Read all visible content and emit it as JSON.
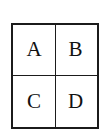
{
  "figure": {
    "kind": "2x2-grid-diagram",
    "background_color": "#ffffff",
    "line_color": "#1b1b1b",
    "text_color": "#111111",
    "rows": 2,
    "columns": 2,
    "cells": [
      {
        "id": "a",
        "label": "A",
        "row": 1,
        "column": 1,
        "position": "top-left"
      },
      {
        "id": "b",
        "label": "B",
        "row": 1,
        "column": 2,
        "position": "top-right"
      },
      {
        "id": "c",
        "label": "C",
        "row": 2,
        "column": 1,
        "position": "bottom-left"
      },
      {
        "id": "d",
        "label": "D",
        "row": 2,
        "column": 2,
        "position": "bottom-right"
      }
    ]
  }
}
